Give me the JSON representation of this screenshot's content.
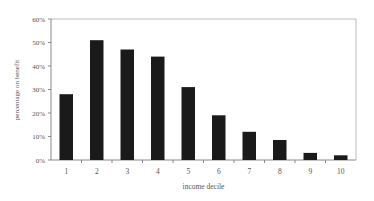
{
  "chart_data": {
    "type": "bar",
    "title": "",
    "xlabel": "income decile",
    "ylabel": "percentage on benefit",
    "categories": [
      "1",
      "2",
      "3",
      "4",
      "5",
      "6",
      "7",
      "8",
      "9",
      "10"
    ],
    "values": [
      28,
      51,
      47,
      44,
      31,
      19,
      12,
      8.5,
      3,
      2
    ],
    "value_unit": "%",
    "ylim": [
      0,
      60
    ],
    "yticks": [
      "0%",
      "10%",
      "20%",
      "30%",
      "40%",
      "50%",
      "60%"
    ],
    "ytick_values": [
      0,
      10,
      20,
      30,
      40,
      50,
      60
    ],
    "grid": false,
    "legend": null,
    "colors": {
      "bar": "#1a1a1a",
      "axis": "#888888",
      "text": "#555555"
    }
  }
}
